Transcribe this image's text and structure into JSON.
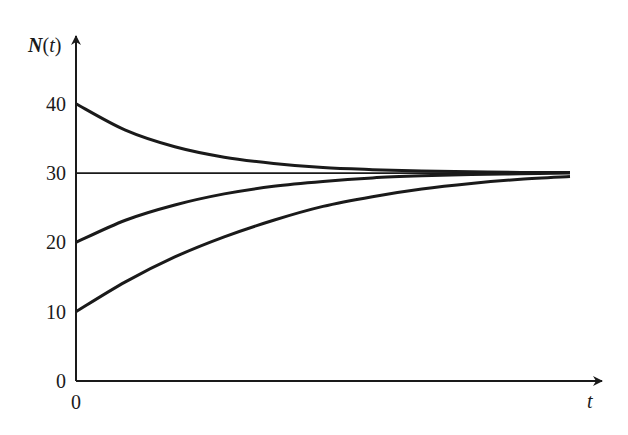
{
  "chart_data": {
    "type": "line",
    "title": "",
    "xlabel": "t",
    "ylabel": "N(t)",
    "ylabel_parts": {
      "N": "N",
      "paren_open": "(",
      "t": "t",
      "paren_close": ")"
    },
    "x_ticks": [
      "0"
    ],
    "y_ticks": [
      "0",
      "10",
      "20",
      "30",
      "40"
    ],
    "ylim": [
      0,
      42
    ],
    "xlim": [
      0,
      1
    ],
    "grid": false,
    "legend": null,
    "equilibrium": {
      "name": "Equilibrium N = 30",
      "value": 30
    },
    "x": [
      0,
      0.1,
      0.2,
      0.3,
      0.4,
      0.5,
      0.6,
      0.7,
      0.8,
      0.9,
      1.0
    ],
    "series": [
      {
        "name": "N(0) = 40",
        "values": [
          40,
          36.2,
          33.8,
          32.3,
          31.4,
          30.8,
          30.5,
          30.3,
          30.2,
          30.1,
          30.1
        ]
      },
      {
        "name": "N(0) = 30",
        "values": [
          30,
          30,
          30,
          30,
          30,
          30,
          30,
          30,
          30,
          30,
          30
        ]
      },
      {
        "name": "N(0) = 20",
        "values": [
          20,
          23.2,
          25.4,
          27.0,
          28.1,
          28.8,
          29.3,
          29.6,
          29.8,
          29.9,
          30.0
        ]
      },
      {
        "name": "N(0) = 10",
        "values": [
          10,
          14.3,
          17.9,
          20.8,
          23.2,
          25.2,
          26.6,
          27.7,
          28.5,
          29.1,
          29.5
        ]
      }
    ]
  }
}
